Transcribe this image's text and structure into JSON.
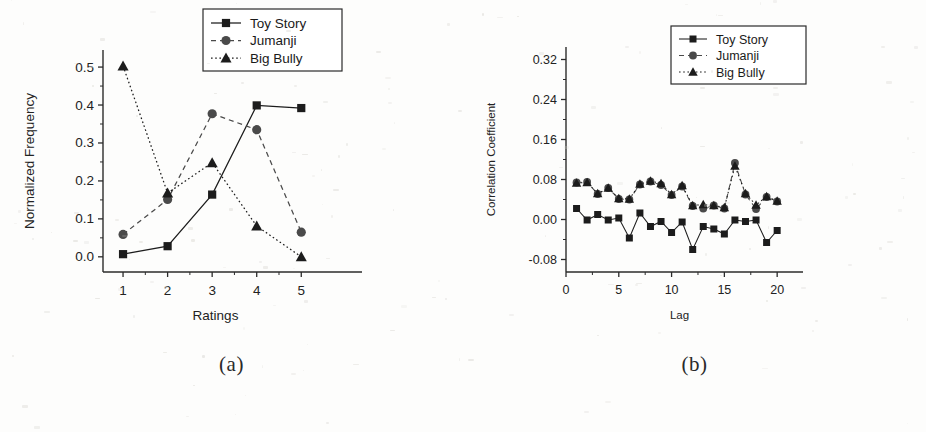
{
  "figure": {
    "panels": [
      {
        "id": "a",
        "caption": "(a)",
        "xlabel": "Ratings",
        "ylabel": "Normalized Frequency",
        "xticks": [
          "1",
          "2",
          "3",
          "4",
          "5"
        ],
        "yticks": [
          "0.0",
          "0.1",
          "0.2",
          "0.3",
          "0.4",
          "0.5"
        ],
        "legend": [
          "Toy Story",
          "Jumanji",
          "Big Bully"
        ]
      },
      {
        "id": "b",
        "caption": "(b)",
        "xlabel": "Lag",
        "ylabel": "Correlation Coefficient",
        "xticks": [
          "0",
          "5",
          "10",
          "15",
          "20"
        ],
        "yticks": [
          "-0.08",
          "0.00",
          "0.08",
          "0.16",
          "0.24",
          "0.32"
        ],
        "legend": [
          "Toy Story",
          "Jumanji",
          "Big Bully"
        ]
      }
    ]
  },
  "chart_data": [
    {
      "type": "line",
      "panel": "a",
      "title": "",
      "xlabel": "Ratings",
      "ylabel": "Normalized Frequency",
      "categories": [
        1,
        2,
        3,
        4,
        5
      ],
      "x": [
        1,
        2,
        3,
        4,
        5
      ],
      "xlim": [
        0.55,
        5.6
      ],
      "ylim": [
        -0.04,
        0.545
      ],
      "grid": false,
      "legend_position": "top-right",
      "series": [
        {
          "name": "Toy Story",
          "marker": "square",
          "linestyle": "solid",
          "color": "#1c1c1c",
          "values": [
            0.007,
            0.028,
            0.164,
            0.399,
            0.392
          ]
        },
        {
          "name": "Jumanji",
          "marker": "circle",
          "linestyle": "dashed",
          "color": "#4a4a4a",
          "values": [
            0.059,
            0.151,
            0.377,
            0.335,
            0.065
          ]
        },
        {
          "name": "Big Bully",
          "marker": "triangle",
          "linestyle": "dotted",
          "color": "#1c1c1c",
          "values": [
            0.503,
            0.168,
            0.248,
            0.081,
            0.0
          ]
        }
      ]
    },
    {
      "type": "line",
      "panel": "b",
      "title": "",
      "xlabel": "Lag",
      "ylabel": "Correlation Coefficient",
      "x": [
        1,
        2,
        3,
        4,
        5,
        6,
        7,
        8,
        9,
        10,
        11,
        12,
        13,
        14,
        15,
        16,
        17,
        18,
        19,
        20
      ],
      "xlim": [
        0,
        21.5
      ],
      "ylim": [
        -0.105,
        0.345
      ],
      "grid": false,
      "legend_position": "top-right",
      "series": [
        {
          "name": "Toy Story",
          "marker": "square",
          "linestyle": "solid",
          "color": "#1c1c1c",
          "values": [
            0.022,
            -0.001,
            0.01,
            -0.001,
            0.003,
            -0.037,
            0.013,
            -0.014,
            -0.004,
            -0.026,
            -0.005,
            -0.06,
            -0.014,
            -0.019,
            -0.029,
            -0.001,
            -0.004,
            -0.001,
            -0.046,
            -0.022
          ]
        },
        {
          "name": "Jumanji",
          "marker": "circle",
          "linestyle": "dashed",
          "color": "#4a4a4a",
          "values": [
            0.074,
            0.075,
            0.051,
            0.063,
            0.041,
            0.04,
            0.07,
            0.076,
            0.069,
            0.049,
            0.066,
            0.027,
            0.022,
            0.028,
            0.022,
            0.113,
            0.05,
            0.021,
            0.045,
            0.036
          ]
        },
        {
          "name": "Big Bully",
          "marker": "triangle",
          "linestyle": "dotted",
          "color": "#1c1c1c",
          "values": [
            0.073,
            0.074,
            0.052,
            0.063,
            0.042,
            0.041,
            0.071,
            0.077,
            0.072,
            0.05,
            0.068,
            0.028,
            0.03,
            0.028,
            0.024,
            0.107,
            0.052,
            0.029,
            0.046,
            0.037
          ]
        }
      ]
    }
  ]
}
